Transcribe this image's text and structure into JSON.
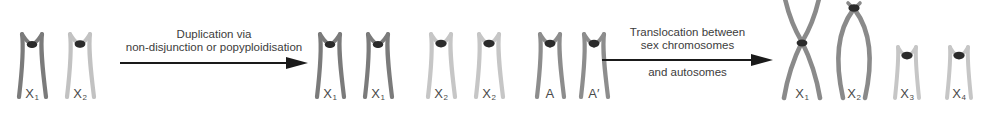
{
  "figure": {
    "type": "chromosome-evolution-diagram",
    "colors": {
      "dark_chromosome": "#7a7a7a",
      "medium_chromosome": "#9a9a9a",
      "light_chromosome": "#c2c2c2",
      "centromere": "#2b2b2b",
      "arrow": "#1a1a1a",
      "text": "#3c3c3c",
      "background": "#ffffff"
    }
  },
  "groups": [
    {
      "id": "initial-karyotype",
      "chromosomes": [
        {
          "label": "X",
          "sub": "1",
          "shade": "dark",
          "shape": "wishbone"
        },
        {
          "label": "X",
          "sub": "2",
          "shade": "light",
          "shape": "wishbone"
        }
      ]
    },
    {
      "id": "duplicated-karyotype",
      "chromosomes": [
        {
          "label": "X",
          "sub": "1",
          "shade": "dark",
          "shape": "wishbone"
        },
        {
          "label": "X",
          "sub": "1",
          "shade": "dark",
          "shape": "wishbone"
        },
        {
          "label": "X",
          "sub": "2",
          "shade": "light",
          "shape": "wishbone"
        },
        {
          "label": "X",
          "sub": "2",
          "shade": "light",
          "shape": "wishbone"
        },
        {
          "label": "A",
          "sub": "",
          "shade": "medium",
          "shape": "wishbone"
        },
        {
          "label": "A′",
          "sub": "",
          "shade": "medium",
          "shape": "wishbone"
        }
      ]
    },
    {
      "id": "translocated-karyotype",
      "chromosomes": [
        {
          "label": "X",
          "sub": "1",
          "shade": "medium",
          "shape": "metacentric-x"
        },
        {
          "label": "X",
          "sub": "2",
          "shade": "medium",
          "shape": "lens"
        },
        {
          "label": "X",
          "sub": "3",
          "shade": "light",
          "shape": "wishbone-small"
        },
        {
          "label": "X",
          "sub": "4",
          "shade": "light",
          "shape": "wishbone-small"
        }
      ]
    }
  ],
  "arrows": [
    {
      "id": "duplication-arrow",
      "lines_above": [
        "Duplication via",
        "non-disjunction or popyploidisation"
      ],
      "lines_below": []
    },
    {
      "id": "translocation-arrow",
      "lines_above": [
        "Translocation between",
        "sex chromosomes"
      ],
      "lines_below": [
        "and autosomes"
      ]
    }
  ]
}
